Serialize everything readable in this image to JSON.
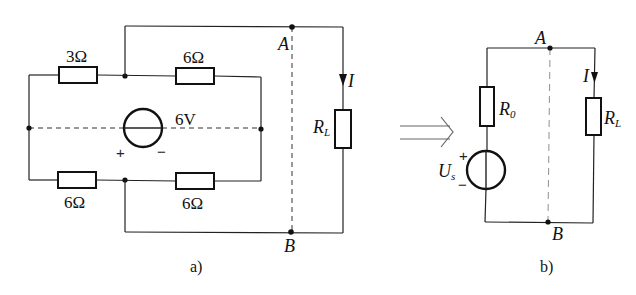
{
  "figure_a": {
    "caption": "a)",
    "resistor_top_left": "3Ω",
    "resistor_top_right": "6Ω",
    "resistor_bottom_left": "6Ω",
    "resistor_bottom_right": "6Ω",
    "source_voltage": "6V",
    "source_plus": "+",
    "source_minus": "−",
    "node_a": "A",
    "node_b": "B",
    "current": "I",
    "load": "R",
    "load_sub": "L"
  },
  "figure_b": {
    "caption": "b)",
    "node_a": "A",
    "node_b": "B",
    "current": "I",
    "r0": "R",
    "r0_sub": "0",
    "load": "R",
    "load_sub": "L",
    "source": "U",
    "source_sub": "s",
    "source_plus": "+",
    "source_minus": "−"
  },
  "transform_arrow": "equivalent-arrow"
}
